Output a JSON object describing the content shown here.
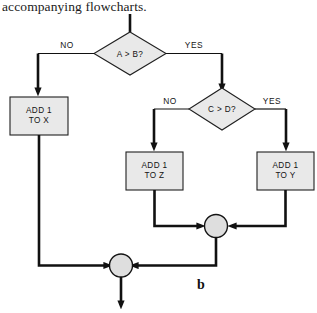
{
  "caption": {
    "text": "accompanying flowcharts."
  },
  "figure": {
    "label": "b"
  },
  "flowchart": {
    "decisions": [
      {
        "id": "d1",
        "text": "A > B?",
        "no_label": "NO",
        "yes_label": "YES"
      },
      {
        "id": "d2",
        "text": "C > D?",
        "no_label": "NO",
        "yes_label": "YES"
      }
    ],
    "processes": [
      {
        "id": "p1",
        "line1": "ADD 1",
        "line2": "TO X"
      },
      {
        "id": "p2",
        "line1": "ADD 1",
        "line2": "TO Z"
      },
      {
        "id": "p3",
        "line1": "ADD 1",
        "line2": "TO Y"
      }
    ],
    "connectors": [
      {
        "id": "c1"
      },
      {
        "id": "c2"
      }
    ],
    "colors": {
      "shape_fill": "#e9e9e9",
      "shape_stroke": "#202020",
      "line": "#111111",
      "connector_fill": "#dedede",
      "background": "#ffffff"
    }
  }
}
